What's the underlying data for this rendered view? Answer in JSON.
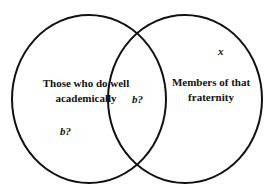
{
  "diagram": {
    "type": "venn",
    "sets": [
      {
        "label_line1": "Those who do well",
        "label_line2": "academically"
      },
      {
        "label_line1": "Members of that",
        "label_line2": "fraternity"
      }
    ],
    "markers": {
      "left_only": "b?",
      "intersection": "b?",
      "right_only": "x"
    },
    "stroke_color": "#111111"
  }
}
